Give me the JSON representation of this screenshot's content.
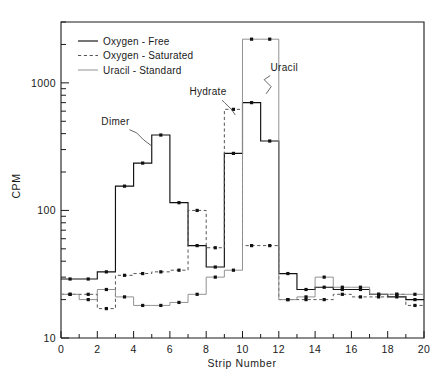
{
  "figure": {
    "background": "#ffffff",
    "frame_color": "#1a1a1a"
  },
  "chart_data": {
    "type": "line",
    "title": "",
    "subtitle": "",
    "xlabel": "Strip  Number",
    "ylabel": "CPM",
    "yscale": "log",
    "xscale": "linear",
    "xlim": [
      0,
      20
    ],
    "ylim": [
      10,
      3000
    ],
    "grid": false,
    "legend_position": "top-left",
    "x_major_ticks": [
      0,
      2,
      4,
      6,
      8,
      10,
      12,
      14,
      16,
      18,
      20
    ],
    "x_major_tick_labels": [
      "0",
      "2",
      "4",
      "6",
      "8",
      "10",
      "12",
      "14",
      "16",
      "18",
      "20"
    ],
    "x_minor_ticks": [
      1,
      3,
      5,
      7,
      9,
      11,
      13,
      15,
      17,
      19
    ],
    "y_major_ticks": [
      10,
      100,
      1000
    ],
    "y_major_tick_labels": [
      "10",
      "100",
      "1000"
    ],
    "y_minor_ticks": [
      20,
      30,
      40,
      50,
      60,
      70,
      80,
      90,
      200,
      300,
      400,
      500,
      600,
      700,
      800,
      900,
      2000,
      3000
    ],
    "style_note": "step histogram, markers at bin centers",
    "x_bin_centers": [
      0.5,
      1.5,
      2.5,
      3.5,
      4.5,
      5.5,
      6.5,
      7.5,
      8.5,
      9.5,
      10.5,
      11.5,
      12.5,
      13.5,
      14.5,
      15.5,
      16.5,
      17.5,
      18.5,
      19.5
    ],
    "series": [
      {
        "name": "Oxygen-Free",
        "linestyle": "solid",
        "color": "#111111",
        "marker": "square-dot",
        "values": [
          29,
          29,
          33,
          155,
          235,
          390,
          115,
          53,
          36,
          280,
          700,
          350,
          32,
          24,
          25,
          24,
          24,
          22,
          21,
          20
        ]
      },
      {
        "name": "Oxygen-Saturated",
        "linestyle": "dashed",
        "color": "#555555",
        "marker": "square-dot",
        "values": [
          22,
          22,
          17,
          31,
          32,
          33,
          34,
          100,
          51,
          620,
          53,
          53,
          20,
          20,
          20,
          22,
          21,
          21,
          22,
          18
        ]
      },
      {
        "name": "Uracil-Standard",
        "linestyle": "thin-solid",
        "color": "#8c8c8c",
        "marker": "square-dot",
        "values": [
          22,
          20,
          24,
          21,
          18,
          18,
          19,
          22,
          30,
          34,
          2200,
          2200,
          20,
          21,
          30,
          25,
          25,
          22,
          22,
          22
        ]
      }
    ],
    "annotations": [
      {
        "text": "Dimer",
        "x": 3.0,
        "y": 470,
        "target_x": 5.0,
        "target_y": 320
      },
      {
        "text": "Hydrate",
        "x": 8.1,
        "y": 800,
        "target_x": 9.6,
        "target_y": 560
      },
      {
        "text": "Uracil",
        "x": 12.3,
        "y": 1250,
        "target_x": 11.3,
        "target_y": 820
      }
    ]
  },
  "legend": {
    "items": [
      {
        "label": "Oxygen - Free",
        "style": "solid"
      },
      {
        "label": "Oxygen - Saturated",
        "style": "dashed"
      },
      {
        "label": "Uracil - Standard",
        "style": "thin-solid"
      }
    ]
  }
}
